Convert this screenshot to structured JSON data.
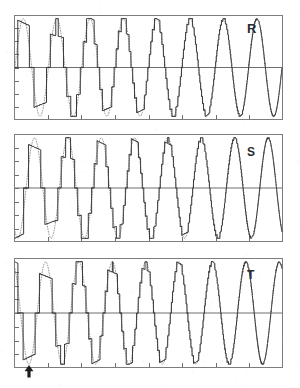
{
  "figure": {
    "background_color": "#ffffff",
    "width": 300,
    "height": 388,
    "trace_color": "#3a3a3a",
    "reference_color": "#8d8d8d",
    "frame_color": "#7d7d7d",
    "axis_color": "#6f6f6f",
    "marker_color": "#1d1d1d"
  },
  "panels": [
    {
      "id": "panel-R",
      "label": "R",
      "phase_deg": 0,
      "frame": {
        "x": 14,
        "y": 15,
        "width": 269,
        "height": 105
      },
      "zero_line_y_frac": 0.5,
      "y_ticks": 8,
      "x_ticks": 8
    },
    {
      "id": "panel-S",
      "label": "S",
      "phase_deg": -120,
      "frame": {
        "x": 14,
        "y": 134,
        "width": 269,
        "height": 108
      },
      "zero_line_y_frac": 0.5,
      "y_ticks": 8,
      "x_ticks": 8
    },
    {
      "id": "panel-T",
      "label": "T",
      "phase_deg": 120,
      "frame": {
        "x": 14,
        "y": 258,
        "width": 269,
        "height": 110
      },
      "zero_line_y_frac": 0.5,
      "y_ticks": 8,
      "x_ticks": 8
    }
  ],
  "marker": {
    "name": "start-arrow",
    "symbol": "▲",
    "x": 29,
    "y": 372,
    "description": "upward arrow below panel T time axis"
  },
  "chart_data": {
    "type": "line",
    "xlabel": "",
    "ylabel": "",
    "xlim": [
      0,
      8
    ],
    "ylim": [
      -1.15,
      1.15
    ],
    "grid": false,
    "legend": "none",
    "x_unit": "reference cycles",
    "cycles": 8,
    "samples_per_cycle": 240,
    "series": [
      {
        "name": "reference",
        "style": "dotted",
        "waveform": "sine",
        "amplitude": 1.0,
        "frequency_cycles": 8,
        "color": "#8d8d8d"
      },
      {
        "name": "output",
        "style": "solid",
        "waveform": "quantized-sine",
        "amplitude": 1.0,
        "frequency_cycles": 8,
        "color": "#3a3a3a",
        "quantization_levels_by_cycle": [
          2,
          3,
          4,
          6,
          9,
          14,
          28,
          80
        ],
        "description": "Stepped staircase whose step count doubles each cycle so the trace converges to the dotted sine by the final cycles"
      }
    ],
    "phases": [
      {
        "label": "R",
        "phase_deg": 0
      },
      {
        "label": "S",
        "phase_deg": -120
      },
      {
        "label": "T",
        "phase_deg": 120
      }
    ],
    "annotations": [
      {
        "text": "▲",
        "name": "start-arrow",
        "x": 0.12,
        "y": -1.3,
        "panel": "T"
      }
    ]
  }
}
